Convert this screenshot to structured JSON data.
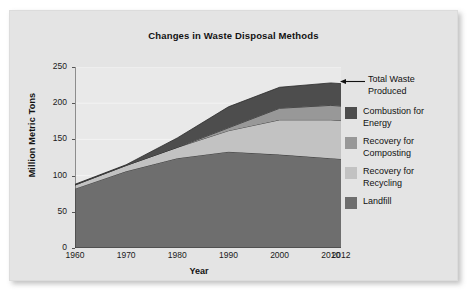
{
  "card": {
    "background": "#e4e4e4"
  },
  "chart_data": {
    "type": "area",
    "title": "Changes in Waste Disposal Methods",
    "xlabel": "Year",
    "ylabel": "Million Metric Tons",
    "stacked": true,
    "grid": true,
    "legend_position": "right",
    "x": [
      1960,
      1970,
      1980,
      1990,
      2000,
      2010,
      2012
    ],
    "xtick_labels": [
      "1960",
      "1970",
      "1980",
      "1990",
      "2000",
      "2010",
      "2012"
    ],
    "ytick_labels": [
      "0",
      "50",
      "100",
      "150",
      "200",
      "250"
    ],
    "yticks": [
      0,
      50,
      100,
      150,
      200,
      250
    ],
    "ylim": [
      0,
      250
    ],
    "xlim": [
      1960,
      2012
    ],
    "series": [
      {
        "name": "Landfill",
        "color": "#6e6e6e",
        "values": [
          82,
          106,
          124,
          133,
          129,
          124,
          123
        ]
      },
      {
        "name": "Recovery for Recycling",
        "color": "#c2c2c2",
        "values": [
          5,
          8,
          15,
          29,
          48,
          53,
          53
        ]
      },
      {
        "name": "Recovery for Composting",
        "color": "#989898",
        "values": [
          0,
          0,
          0,
          4,
          16,
          20,
          20
        ]
      },
      {
        "name": "Combustion for Energy",
        "color": "#4d4d4d",
        "values": [
          1,
          1,
          13,
          29,
          29,
          31,
          31
        ]
      }
    ],
    "totals": [
      88,
      115,
      152,
      195,
      222,
      228,
      227
    ],
    "annotations": [
      {
        "label": "Total Waste Produced",
        "target_x": 2012,
        "target_y": 228
      }
    ]
  },
  "legend": {
    "annotation_label": "Total Waste Produced",
    "items": [
      {
        "label": "Combustion for Energy",
        "color": "#4d4d4d"
      },
      {
        "label": "Recovery for Composting",
        "color": "#989898"
      },
      {
        "label": "Recovery for Recycling",
        "color": "#c2c2c2"
      },
      {
        "label": "Landfill",
        "color": "#6e6e6e"
      }
    ]
  }
}
